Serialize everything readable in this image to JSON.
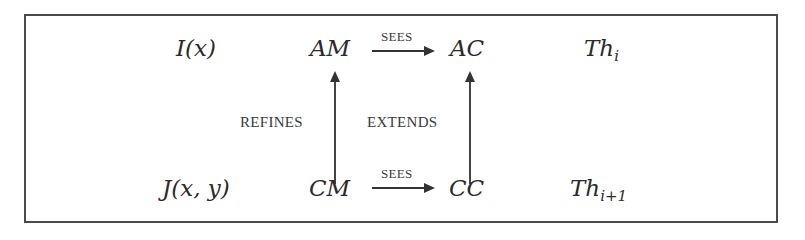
{
  "diagram": {
    "type": "commutative-diagram",
    "rows": [
      {
        "invariant": {
          "base": "I(x)"
        },
        "machine": "AM",
        "sees_label": "SEES",
        "context": "AC",
        "theory": {
          "base": "Th",
          "subscript": "i"
        }
      },
      {
        "invariant": {
          "base": "J(x, y)"
        },
        "machine": "CM",
        "sees_label": "SEES",
        "context": "CC",
        "theory": {
          "base": "Th",
          "subscript": "i+1"
        }
      }
    ],
    "vertical_edges": {
      "left_label": "REFINES",
      "right_label": "EXTENDS"
    },
    "edges": [
      {
        "from": "AM",
        "to": "AC",
        "label": "SEES"
      },
      {
        "from": "CM",
        "to": "CC",
        "label": "SEES"
      },
      {
        "from": "CM",
        "to": "AM",
        "label": "REFINES"
      },
      {
        "from": "CC",
        "to": "AC",
        "label": "EXTENDS"
      }
    ],
    "colors": {
      "ink": "#2b2b2b",
      "frame": "#4a4a4a",
      "background": "#ffffff"
    }
  }
}
